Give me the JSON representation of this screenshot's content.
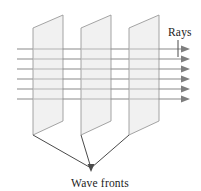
{
  "figure": {
    "name": "wave-fronts-and-rays",
    "caption": "Wave fronts",
    "rays_label": "Rays",
    "background_color": "#ffffff",
    "panel_fill_color": "#f1f1f1",
    "panel_stroke_color": "#9a9a9a",
    "ray_color": "#8e8e8e",
    "ray_inside_color": "#a8a8a8",
    "arrow_color": "#7e7e7e",
    "pointer_color": "#4a4a4a",
    "text_color": "#1b1b1b"
  },
  "labels": {
    "rays": {
      "text": "Rays",
      "x": 168,
      "y": 36
    },
    "wave_fronts": {
      "text": "Wave fronts",
      "x": 100,
      "y": 187
    }
  },
  "panels": [
    {
      "id": "wave-front-1",
      "points": "33,28 63,15 63,121 33,135",
      "bottom_left_x": 33,
      "bottom_left_y": 135
    },
    {
      "id": "wave-front-2",
      "points": "81,28 111,15 111,121 81,135",
      "bottom_left_x": 81,
      "bottom_left_y": 135
    },
    {
      "id": "wave-front-3",
      "points": "129,28 159,15 159,121 129,135",
      "bottom_left_x": 129,
      "bottom_left_y": 135
    }
  ],
  "rays": {
    "count": 6,
    "x_start": 17,
    "x_end": 190,
    "y_values": [
      49,
      59,
      69,
      79,
      89,
      99
    ],
    "arrow_tip_x": 190,
    "arrow_length": 9,
    "arrow_half_height": 3.6
  },
  "pointers": {
    "converge_x": 91,
    "converge_y": 168,
    "arrow_tip_x": 91,
    "arrow_tip_y": 172,
    "lines": [
      {
        "id": "pointer-from-panel-1",
        "from_x": 33,
        "from_y": 135,
        "to_x": 91,
        "to_y": 168
      },
      {
        "id": "pointer-from-panel-2",
        "from_x": 81,
        "from_y": 135,
        "to_x": 91,
        "to_y": 168
      },
      {
        "id": "pointer-from-panel-3",
        "from_x": 129,
        "from_y": 135,
        "to_x": 91,
        "to_y": 168
      }
    ]
  },
  "rays_pointer": {
    "id": "rays-leader",
    "from_x": 178,
    "from_y": 40,
    "to_x": 178,
    "to_y": 58
  }
}
